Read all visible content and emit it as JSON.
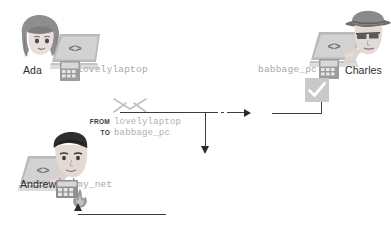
{
  "scene": {
    "title": "Network packet routed from lovelylaptop through my_net to babbage_pc"
  },
  "actors": [
    {
      "id": "ada",
      "name": "Ada",
      "host": "lovelylaptop",
      "role": "sender",
      "laptop_glyph": "<>"
    },
    {
      "id": "charles",
      "name": "Charles",
      "host": "babbage_pc",
      "role": "recipient",
      "laptop_glyph": "<>"
    },
    {
      "id": "andrew",
      "name": "Andrew",
      "host": "my_net",
      "role": "router",
      "laptop_glyph": "<>"
    }
  ],
  "packet": {
    "from_label": "FROM",
    "from_value": "lovelylaptop",
    "to_label": "TO",
    "to_value": "babbage_pc",
    "icon": "envelope-icon"
  },
  "icons": {
    "firewall": "flame-icon",
    "accepted": "checkmark-box-icon",
    "router_device": "router-device-icon",
    "envelope": "envelope-icon"
  },
  "colors": {
    "line": "#3d3d3d",
    "host_text": "#a8a8a8",
    "person_text": "#2b2b2b",
    "packet_label": "#3a3a3a",
    "check_box_fill": "#c9c9c9",
    "check_mark": "#ffffff",
    "flame": "#9a9a9a",
    "background": "#ffffff"
  },
  "flow": {
    "outbound_label": "",
    "inbound_label": "",
    "steps": [
      "lovelylaptop sends packet",
      "my_net firewall inspects",
      "packet forwarded",
      "babbage_pc accepts"
    ]
  }
}
